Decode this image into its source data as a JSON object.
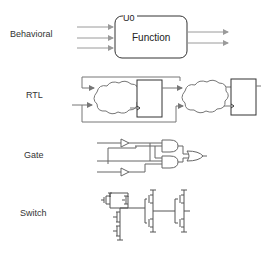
{
  "diagram": {
    "levels": [
      {
        "label": "Behavioral"
      },
      {
        "label": "RTL"
      },
      {
        "label": "Gate"
      },
      {
        "label": "Switch"
      }
    ],
    "behavioral": {
      "instance_name": "U0",
      "block_label": "Function",
      "inputs": 3,
      "outputs": 2
    },
    "rtl": {
      "combinational_clouds": 2,
      "registers": 2
    },
    "gate": {
      "inverters": 2,
      "and_gates": 2,
      "or_gates": 1
    },
    "switch": {
      "transistor_stages": 3
    },
    "colors": {
      "arrow": "#9a9a9a",
      "line": "#666666",
      "box": "#333333",
      "text": "#333333"
    }
  }
}
